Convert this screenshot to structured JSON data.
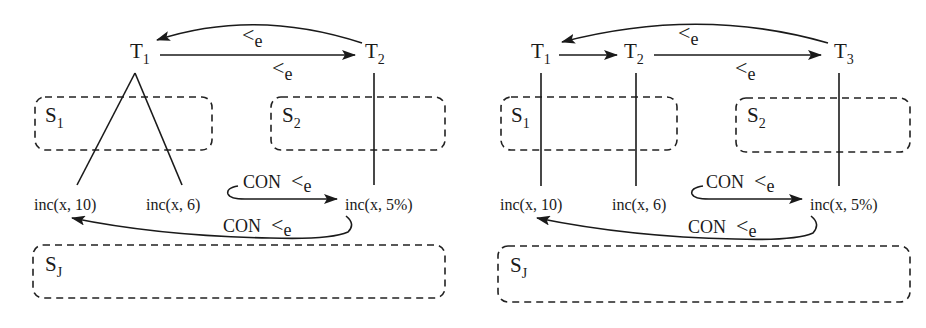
{
  "diagrams": [
    {
      "id": "left",
      "transactions": [
        {
          "label": "T",
          "sub": "1"
        },
        {
          "label": "T",
          "sub": "2"
        }
      ],
      "sites": [
        {
          "label": "S",
          "sub": "1"
        },
        {
          "label": "S",
          "sub": "2"
        },
        {
          "label": "S",
          "sub": "J"
        }
      ],
      "operations": [
        "inc(x, 10)",
        "inc(x, 6)",
        "inc(x, 5%)"
      ],
      "edges": [
        {
          "from": "T2",
          "to": "T1",
          "label": "<",
          "sub": "e"
        },
        {
          "from": "T1",
          "to": "T2",
          "label": "<",
          "sub": "e"
        },
        {
          "from": "inc(x, 6)",
          "to": "inc(x, 5%)",
          "prefix": "CON",
          "label": "<",
          "sub": "e"
        },
        {
          "from": "inc(x, 5%)",
          "to": "inc(x, 10)",
          "prefix": "CON",
          "label": "<",
          "sub": "e"
        }
      ]
    },
    {
      "id": "right",
      "transactions": [
        {
          "label": "T",
          "sub": "1"
        },
        {
          "label": "T",
          "sub": "2"
        },
        {
          "label": "T",
          "sub": "3"
        }
      ],
      "sites": [
        {
          "label": "S",
          "sub": "1"
        },
        {
          "label": "S",
          "sub": "2"
        },
        {
          "label": "S",
          "sub": "J"
        }
      ],
      "operations": [
        "inc(x, 10)",
        "inc(x, 6)",
        "inc(x, 5%)"
      ],
      "edges": [
        {
          "from": "T3",
          "to": "T1",
          "label": "<",
          "sub": "e"
        },
        {
          "from": "T1",
          "to": "T2",
          "label": "",
          "sub": ""
        },
        {
          "from": "T2",
          "to": "T3",
          "label": "<",
          "sub": "e"
        },
        {
          "from": "inc(x, 6)",
          "to": "inc(x, 5%)",
          "prefix": "CON",
          "label": "<",
          "sub": "e"
        },
        {
          "from": "inc(x, 5%)",
          "to": "inc(x, 10)",
          "prefix": "CON",
          "label": "<",
          "sub": "e"
        }
      ]
    }
  ],
  "colors": {
    "ink": "#1a1a1a",
    "background": "#ffffff"
  }
}
